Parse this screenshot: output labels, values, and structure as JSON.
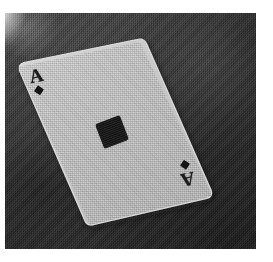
{
  "scene": {
    "subject": "playing-card",
    "card_name": "Ace of Diamonds",
    "rank": "A",
    "suit": "diamonds",
    "suit_symbol": "♦",
    "medium": "black-and-white halftone photograph",
    "background_description": "dark textured cloth",
    "caption": ""
  },
  "card": {
    "rank_label": "A",
    "index_top_left": {
      "letter": "A",
      "pip": "♦"
    },
    "index_bottom_right": {
      "letter": "A",
      "pip": "♦"
    },
    "center_pip": "♦",
    "rotation_degrees": -11.6,
    "corners": {
      "left": {
        "x": 18,
        "y": 67
      },
      "top": {
        "x": 140,
        "y": 42
      },
      "right": {
        "x": 212,
        "y": 196
      },
      "bottom": {
        "x": 90,
        "y": 225
      }
    }
  },
  "colors": {
    "card_face": "#c9c9c9",
    "card_face_highlight": "#dcdcdc",
    "card_face_shadow": "#aeaeae",
    "card_edge": "#e4e4e4",
    "pip_ink": "#141414",
    "index_ink": "#1c1c1c",
    "background_dark": "#343434",
    "background_darkest": "#2a2a2a",
    "scan_margin": "#ffffff"
  },
  "geometry": {
    "image_width": 273,
    "image_height": 262,
    "photo_plate": {
      "x": 5,
      "y": 13,
      "width": 251,
      "height": 236
    },
    "center_pip": {
      "x": 99,
      "y": 119,
      "size": 26,
      "rotation_degrees": -21
    },
    "index_top_left": {
      "x": 26,
      "y": 66
    },
    "index_bottom_right": {
      "x": 176,
      "y": 160
    }
  }
}
